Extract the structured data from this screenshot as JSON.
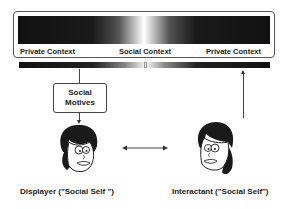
{
  "context_scale": {
    "labels": [
      {
        "text": "Private Context",
        "position": "left"
      },
      {
        "text": "Social Context",
        "position": "center"
      },
      {
        "text": "Private Context",
        "position": "right"
      }
    ]
  },
  "motives_box": {
    "line1": "Social",
    "line2": "Motives"
  },
  "displayer": {
    "caption": "Displayer (\"Social Self \")",
    "icon": "face-icon"
  },
  "interactant": {
    "caption": "Interactant (\"Social Self\")",
    "icon": "face-icon"
  },
  "connector": {
    "icon": "double-arrow-icon"
  },
  "colors": {
    "dark": "#111111",
    "light": "#ffffff",
    "stroke": "#444444"
  }
}
